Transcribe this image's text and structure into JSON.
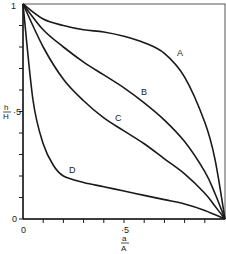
{
  "chart_data": {
    "type": "line",
    "title": "",
    "xlabel": "a/A",
    "ylabel": "h/H",
    "xlim": [
      0,
      1
    ],
    "ylim": [
      0,
      1
    ],
    "grid": false,
    "legend": "inline curve labels",
    "x_ticks": [
      0,
      0.1,
      0.2,
      0.3,
      0.4,
      0.5,
      0.6,
      0.7,
      0.8,
      0.9,
      1.0
    ],
    "y_ticks": [
      0,
      0.1,
      0.2,
      0.3,
      0.4,
      0.5,
      0.6,
      0.7,
      0.8,
      0.9,
      1.0
    ],
    "x_tick_labels": {
      "0": "0",
      "0.5": "·5"
    },
    "y_tick_labels": {
      "0": "0",
      "0.5": "·5",
      "1": "1"
    },
    "series": [
      {
        "name": "A",
        "x": [
          0,
          0.1,
          0.2,
          0.3,
          0.4,
          0.5,
          0.6,
          0.7,
          0.8,
          0.9,
          0.95,
          1.0
        ],
        "y": [
          1.0,
          0.93,
          0.9,
          0.88,
          0.87,
          0.85,
          0.82,
          0.77,
          0.66,
          0.45,
          0.28,
          0.0
        ]
      },
      {
        "name": "B",
        "x": [
          0,
          0.1,
          0.2,
          0.3,
          0.4,
          0.5,
          0.6,
          0.7,
          0.8,
          0.9,
          0.95,
          1.0
        ],
        "y": [
          1.0,
          0.88,
          0.8,
          0.73,
          0.67,
          0.61,
          0.54,
          0.46,
          0.36,
          0.22,
          0.12,
          0.0
        ]
      },
      {
        "name": "C",
        "x": [
          0,
          0.1,
          0.2,
          0.3,
          0.4,
          0.5,
          0.6,
          0.7,
          0.8,
          0.9,
          0.95,
          1.0
        ],
        "y": [
          1.0,
          0.8,
          0.65,
          0.55,
          0.47,
          0.41,
          0.35,
          0.28,
          0.21,
          0.12,
          0.06,
          0.0
        ]
      },
      {
        "name": "D",
        "x": [
          0,
          0.05,
          0.1,
          0.15,
          0.2,
          0.3,
          0.4,
          0.5,
          0.6,
          0.7,
          0.8,
          0.9,
          1.0
        ],
        "y": [
          1.0,
          0.55,
          0.35,
          0.25,
          0.2,
          0.17,
          0.15,
          0.13,
          0.11,
          0.09,
          0.07,
          0.04,
          0.0
        ]
      }
    ],
    "annotations": [
      {
        "text": "A",
        "x": 0.8,
        "y": 0.76
      },
      {
        "text": "B",
        "x": 0.58,
        "y": 0.57
      },
      {
        "text": "C",
        "x": 0.48,
        "y": 0.46
      },
      {
        "text": "D",
        "x": 0.21,
        "y": 0.23
      }
    ]
  },
  "labels": {
    "y_tick_1": "1",
    "y_tick_half": "·5",
    "y_tick_0": "0",
    "x_tick_0": "0",
    "x_tick_half": "·5",
    "y_axis_num": "h",
    "y_axis_den": "H",
    "x_axis_num": "a",
    "x_axis_den": "A",
    "curve_A": "A",
    "curve_B": "B",
    "curve_C": "C",
    "curve_D": "D"
  },
  "colors": {
    "line": "#1a1a1a",
    "background": "#ffffff"
  }
}
